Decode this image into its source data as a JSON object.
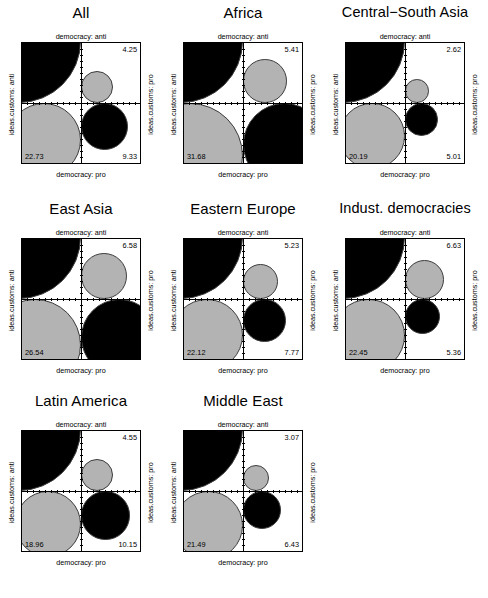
{
  "figure": {
    "type": "fourfold-display-matrix",
    "rows": 3,
    "cols": 3,
    "colors": {
      "anti_anti_fill": "#000000",
      "pro_pro_fill": "#000000",
      "off_diagonal_fill": "#b3b3b3",
      "wedge_outline": "#3c3c3c",
      "frame": "#000000",
      "background": "#ffffff"
    }
  },
  "axis_labels": {
    "top": "democracy: anti",
    "bottom": "democracy: pro",
    "left": "ideas.customs: anti",
    "right": "ideas.customs: pro"
  },
  "chart_data": {
    "type": "table",
    "title": "",
    "xlabel": "democracy",
    "ylabel": "ideas.customs",
    "row_levels": [
      "anti",
      "pro"
    ],
    "col_levels": [
      "anti",
      "pro"
    ],
    "cell_order": [
      "top_left",
      "top_right",
      "bottom_left",
      "bottom_right"
    ],
    "cell_meaning": {
      "top_left": "democracy: anti / ideas.customs: anti",
      "top_right": "democracy: pro / ideas.customs: anti",
      "bottom_left": "democracy: anti / ideas.customs: pro",
      "bottom_right": "democracy: pro / ideas.customs: pro"
    },
    "panels": [
      {
        "title": "All",
        "top_left": "63.69",
        "top_right": "4.25",
        "bottom_left": "22.73",
        "bottom_right": "9.33",
        "values": [
          63.69,
          4.25,
          22.73,
          9.33
        ]
      },
      {
        "title": "Africa",
        "top_left": "43.43",
        "top_right": "5.41",
        "bottom_left": "31.68",
        "bottom_right": "19.47",
        "values": [
          43.43,
          5.41,
          31.68,
          19.47
        ]
      },
      {
        "title": "Central−South Asia",
        "top_left": "72.17",
        "top_right": "2.62",
        "bottom_left": "20.19",
        "bottom_right": "5.01",
        "values": [
          72.17,
          2.62,
          20.19,
          5.01
        ]
      },
      {
        "title": "East Asia",
        "top_left": "48.2",
        "top_right": "6.58",
        "bottom_left": "26.54",
        "bottom_right": "18.68",
        "values": [
          48.2,
          6.58,
          26.54,
          18.68
        ]
      },
      {
        "title": "Eastern Europe",
        "top_left": "64.88",
        "top_right": "5.23",
        "bottom_left": "22.12",
        "bottom_right": "7.77",
        "values": [
          64.88,
          5.23,
          22.12,
          7.77
        ]
      },
      {
        "title": "Indust. democracies",
        "top_left": "65.56",
        "top_right": "6.63",
        "bottom_left": "22.45",
        "bottom_right": "5.36",
        "values": [
          65.56,
          6.63,
          22.45,
          5.36
        ]
      },
      {
        "title": "Latin America",
        "top_left": "66.34",
        "top_right": "4.55",
        "bottom_left": "18.96",
        "bottom_right": "10.15",
        "values": [
          66.34,
          4.55,
          18.96,
          10.15
        ]
      },
      {
        "title": "Middle East",
        "top_left": "69",
        "top_right": "3.07",
        "bottom_left": "21.49",
        "bottom_right": "6.43",
        "values": [
          69,
          3.07,
          21.49,
          6.43
        ]
      }
    ]
  }
}
